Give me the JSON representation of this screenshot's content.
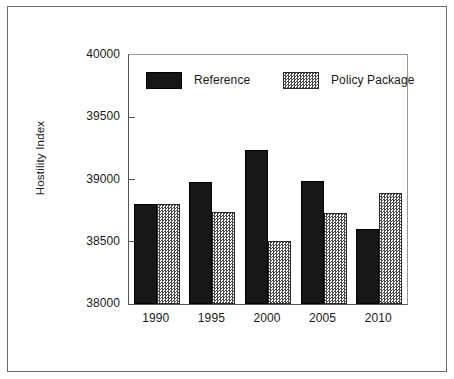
{
  "chart_data": {
    "type": "bar",
    "title": "",
    "xlabel": "",
    "ylabel": "Hostility Index",
    "categories": [
      "1990",
      "1995",
      "2000",
      "2005",
      "2010"
    ],
    "series": [
      {
        "name": "Reference",
        "values": [
          38800,
          38980,
          39240,
          38985,
          38600
        ],
        "fill": "solid-black",
        "color": "#171717"
      },
      {
        "name": "Policy Package",
        "values": [
          38800,
          38740,
          38510,
          38735,
          38890
        ],
        "fill": "checkerboard-hatch",
        "color": "#4a4a4a"
      }
    ],
    "ylim": [
      38000,
      40000
    ],
    "yticks": [
      38000,
      38500,
      39000,
      39500,
      40000
    ],
    "ytick_labels": [
      "38000",
      "38500",
      "39000",
      "39500",
      "40000"
    ],
    "grid": false,
    "legend_position": "upper-center-inside",
    "bar_group_order": [
      "Reference",
      "Policy Package"
    ]
  },
  "legend": {
    "entries": [
      {
        "label": "Reference",
        "swatch": "solid-black-swatch"
      },
      {
        "label": "Policy Package",
        "swatch": "checkered-swatch"
      }
    ]
  },
  "axes": {
    "y_label": "Hostility Index"
  }
}
